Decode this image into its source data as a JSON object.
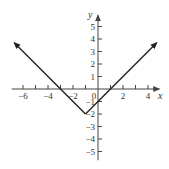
{
  "chart_data": {
    "type": "line",
    "title": "",
    "function": "y = |x + 1| - 2",
    "xlabel": "x",
    "ylabel": "y",
    "xlim": [
      -7,
      5
    ],
    "ylim": [
      -6,
      6
    ],
    "grid": false,
    "x_tick_labels": [
      "-6",
      "-4",
      "-2",
      "0",
      "2",
      "4"
    ],
    "y_tick_labels": [
      "5",
      "4",
      "3",
      "2",
      "1",
      "-1",
      "-2",
      "-3",
      "-4",
      "-5"
    ],
    "series": [
      {
        "name": "absolute value graph",
        "x": [
          -7,
          -1,
          5
        ],
        "y": [
          4,
          -2,
          4
        ],
        "vertex": [
          -1,
          -2
        ],
        "arrows_at_ends": true
      }
    ]
  },
  "layout": {
    "origin_px": [
      98,
      89
    ],
    "unit_px": 12.5,
    "line_color": "#222222",
    "axis_color": "#444444"
  }
}
